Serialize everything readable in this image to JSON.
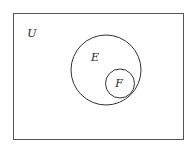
{
  "diagram": {
    "type": "venn",
    "universe": {
      "label": "U",
      "x": 13,
      "y": 13,
      "width": 170,
      "height": 126
    },
    "sets": [
      {
        "label": "E",
        "cx": 106,
        "cy": 70,
        "r": 35,
        "label_x": 95,
        "label_y": 60
      },
      {
        "label": "F",
        "cx": 120,
        "cy": 83,
        "r": 14.5,
        "label_x": 119,
        "label_y": 86
      }
    ],
    "relationship": "F is a subset of E",
    "colors": {
      "stroke": "#333333",
      "background": "#ffffff",
      "text": "#222222"
    }
  }
}
